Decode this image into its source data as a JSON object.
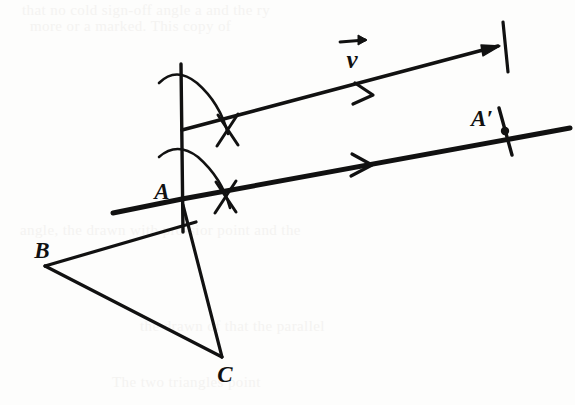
{
  "figure": {
    "background_color": "#fdfdfc",
    "ink_color": "#111111",
    "bleed_color": "#f4f3f1",
    "labels": {
      "vector_v": "ν",
      "point_a": "A",
      "point_a_prime": "A′",
      "point_b": "B",
      "point_c": "C"
    },
    "bleed_through_lines": [
      {
        "text": "that no cold sign-off angle a and the ry",
        "x": 22,
        "y": 2
      },
      {
        "text": "more or a marked. This copy of",
        "x": 30,
        "y": 18
      },
      {
        "text": "angle, the drawn with pro-sior point and the",
        "x": 20,
        "y": 222
      },
      {
        "text": "the drawn of  that the parallel",
        "x": 140,
        "y": 318
      },
      {
        "text": "The two triangles point",
        "x": 112,
        "y": 374
      }
    ],
    "geometry": {
      "point_a": {
        "x": 182,
        "y": 200
      },
      "point_a_prime": {
        "x": 505,
        "y": 131
      },
      "point_b": {
        "x": 45,
        "y": 266
      },
      "point_c": {
        "x": 222,
        "y": 357
      },
      "vector_start": {
        "x": 185,
        "y": 130
      },
      "vector_end": {
        "x": 500,
        "y": 46
      }
    }
  }
}
